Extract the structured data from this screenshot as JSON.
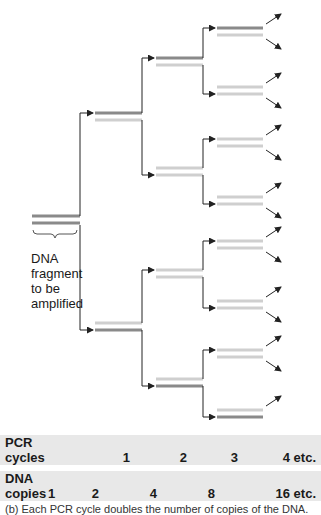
{
  "figure": {
    "fragment_label": [
      "DNA",
      "fragment",
      "to be",
      "amplified"
    ],
    "colors": {
      "original_strand": "#8a8a8a",
      "new_strand": "#cfcfcf",
      "arrow": "#222222",
      "table_bg": "#e8e8e8"
    }
  },
  "table": {
    "pcr_cycles": {
      "label_line1": "PCR",
      "label_line2": "cycles",
      "values": [
        "1",
        "2",
        "3",
        "4 etc."
      ]
    },
    "dna_copies": {
      "label_line1": "DNA",
      "label_line2": "copies",
      "values": [
        "1",
        "2",
        "4",
        "8",
        "16 etc."
      ]
    }
  },
  "caption": "(b) Each PCR cycle doubles the number of copies of the DNA."
}
